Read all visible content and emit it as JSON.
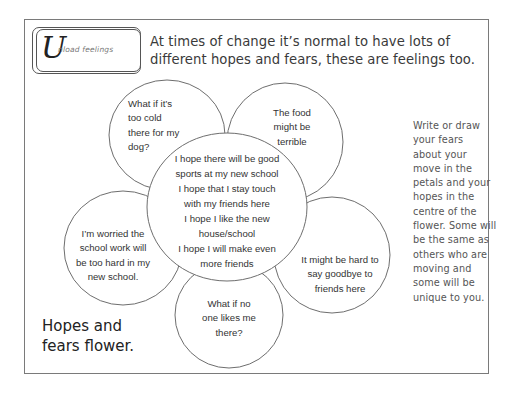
{
  "logo": {
    "initial": "U",
    "label": "nload feelings"
  },
  "headline": {
    "line1": "At times of change it’s normal to have lots of",
    "line2": "different hopes and fears, these are feelings too."
  },
  "flower": {
    "centre": {
      "hopes": [
        {
          "line1": "I hope there will be good",
          "line2": "sports at my new school"
        },
        {
          "line1": "I hope that I stay touch",
          "line2": "with my friends here"
        },
        {
          "line1": "I hope I like the new",
          "line2": "house/school"
        },
        {
          "line1": "I hope I will make even",
          "line2": "more friends"
        }
      ]
    },
    "petals": [
      {
        "id": "top-left",
        "lines": [
          "What if it’s",
          "too cold",
          "there for my",
          "dog?"
        ]
      },
      {
        "id": "top-right",
        "lines": [
          "The food",
          "might be",
          "terrible"
        ]
      },
      {
        "id": "right",
        "lines": [
          "It might be hard to",
          "say goodbye to",
          "friends here"
        ]
      },
      {
        "id": "bottom",
        "lines": [
          "What if no",
          "one likes me",
          "there?"
        ]
      },
      {
        "id": "left",
        "lines": [
          "I’m worried the",
          "school work will",
          "be too hard in my",
          "new school."
        ]
      }
    ],
    "colors": {
      "outline": "#6e6e6e",
      "fill": "#ffffff",
      "text": "#333333"
    }
  },
  "instructions": {
    "lines": [
      "Write or draw",
      "your fears",
      "about your",
      "move in the",
      "petals and your",
      "hopes in the",
      "centre of the",
      "flower. Some will",
      "be the same as",
      "others who are",
      "moving and",
      "some will be",
      "unique to you."
    ]
  },
  "title": {
    "line1": "Hopes and",
    "line2": "fears flower."
  }
}
